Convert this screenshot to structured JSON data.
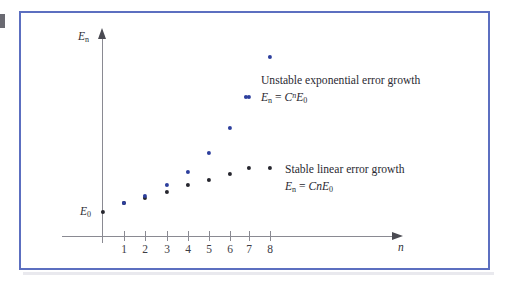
{
  "figure": {
    "border_color": "#5c6fc0",
    "background": "#ffffff"
  },
  "axes": {
    "y_label": "E",
    "y_label_sub": "n",
    "x_label": "n",
    "origin_label": "E",
    "origin_label_sub": "0",
    "x_ticks": [
      "1",
      "2",
      "3",
      "4",
      "5",
      "6",
      "7",
      "8"
    ]
  },
  "legend": {
    "exponential": {
      "marker_color": "#2d3f9d",
      "title": "Unstable exponential error growth",
      "formula_lhs": "E",
      "formula_lhs_sub": "n",
      "formula_eq": "=",
      "formula_C": "C",
      "formula_exp": "n",
      "formula_E": "E",
      "formula_E_sub": "0"
    },
    "linear": {
      "marker_color": "#26262e",
      "title": "Stable linear error growth",
      "formula_lhs": "E",
      "formula_lhs_sub": "n",
      "formula_eq": "=",
      "formula_C": "C",
      "formula_n": "n",
      "formula_E": "E",
      "formula_E_sub": "0"
    }
  },
  "chart_data": {
    "type": "scatter",
    "title": "",
    "xlabel": "n",
    "ylabel": "E_n",
    "xlim": [
      0,
      9
    ],
    "ylim": [
      0,
      10
    ],
    "grid": false,
    "legend_position": "inline-right",
    "x": [
      0,
      1,
      2,
      3,
      4,
      5,
      6,
      7,
      8
    ],
    "series": [
      {
        "name": "Unstable exponential error growth",
        "formula": "E_n = C^n E_0",
        "color": "#2d3f9d",
        "x": [
          1,
          2,
          3,
          4,
          5,
          6,
          7,
          8
        ],
        "values": [
          0.55,
          0.9,
          1.45,
          2.1,
          3.1,
          4.45,
          6.35,
          8.6
        ],
        "px": [
          {
            "x": 124,
            "y": 203
          },
          {
            "x": 145,
            "y": 196
          },
          {
            "x": 167,
            "y": 185
          },
          {
            "x": 188,
            "y": 172
          },
          {
            "x": 209,
            "y": 153
          },
          {
            "x": 230,
            "y": 128
          },
          {
            "x": 249,
            "y": 97
          },
          {
            "x": 270,
            "y": 57
          }
        ]
      },
      {
        "name": "Stable linear error growth",
        "formula": "E_n = CnE_0",
        "color": "#26262e",
        "x": [
          0,
          1,
          2,
          3,
          4,
          5,
          6,
          7
        ],
        "values": [
          0.22,
          0.5,
          0.82,
          1.15,
          1.5,
          1.85,
          2.2,
          2.55
        ],
        "px": [
          {
            "x": 103,
            "y": 212
          },
          {
            "x": 124,
            "y": 203
          },
          {
            "x": 145,
            "y": 198
          },
          {
            "x": 167,
            "y": 192
          },
          {
            "x": 188,
            "y": 185
          },
          {
            "x": 209,
            "y": 180
          },
          {
            "x": 230,
            "y": 174
          },
          {
            "x": 249,
            "y": 168
          }
        ]
      }
    ]
  }
}
